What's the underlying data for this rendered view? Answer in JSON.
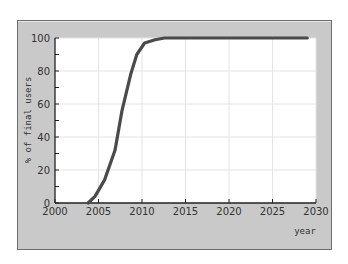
{
  "chart_data": {
    "type": "line",
    "title": "",
    "xlabel": "year",
    "ylabel": "% of final users",
    "xlim": [
      2000,
      2030
    ],
    "ylim": [
      0,
      100
    ],
    "x_ticks": [
      2000,
      2005,
      2010,
      2015,
      2020,
      2025,
      2030
    ],
    "y_ticks": [
      0,
      20,
      40,
      60,
      80,
      100
    ],
    "grid": true,
    "legend": null,
    "series": [
      {
        "name": "adoption",
        "color": "#4a4a4a",
        "x": [
          2003.8,
          2004.6,
          2005.7,
          2006.9,
          2007.7,
          2008.7,
          2009.4,
          2010.3,
          2011.5,
          2012.6,
          2015,
          2020,
          2025,
          2029
        ],
        "y": [
          0,
          4,
          14,
          32,
          56,
          78,
          90,
          97,
          99,
          100,
          100,
          100,
          100,
          100
        ]
      }
    ]
  },
  "colors": {
    "frame_bg": "#c9c9c9",
    "plot_bg": "#ffffff",
    "grid": "#e4e4e4",
    "line": "#4a4a4a"
  }
}
